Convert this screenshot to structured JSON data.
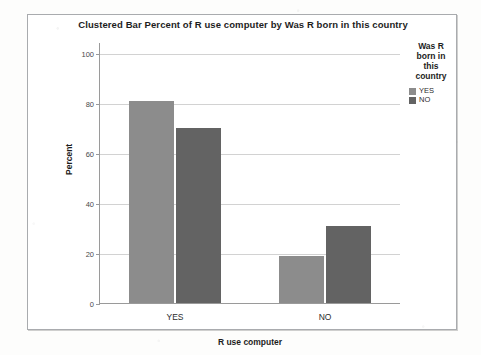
{
  "chart_data": {
    "type": "bar",
    "title": "Clustered Bar Percent of R use computer by Was R born in this country",
    "xlabel": "R use computer",
    "ylabel": "Percent",
    "categories": [
      "YES",
      "NO"
    ],
    "series": [
      {
        "name": "YES",
        "color": "#8c8c8c",
        "values": [
          81,
          19
        ]
      },
      {
        "name": "NO",
        "color": "#636363",
        "values": [
          70,
          31
        ]
      }
    ],
    "legend_title": "Was R born in this country",
    "legend_position": "right",
    "ylim": [
      0,
      100
    ],
    "yticks": [
      0,
      20,
      40,
      60,
      80,
      100
    ],
    "ytick_labels": [
      "0",
      "20",
      "40",
      "60",
      "80",
      "100"
    ],
    "grid": true,
    "grid_axis": "y"
  },
  "legend": {
    "title_lines": [
      "Was R",
      "born in",
      "this",
      "country"
    ],
    "items": [
      {
        "label": "YES",
        "color": "#8c8c8c"
      },
      {
        "label": "NO",
        "color": "#636363"
      }
    ]
  }
}
